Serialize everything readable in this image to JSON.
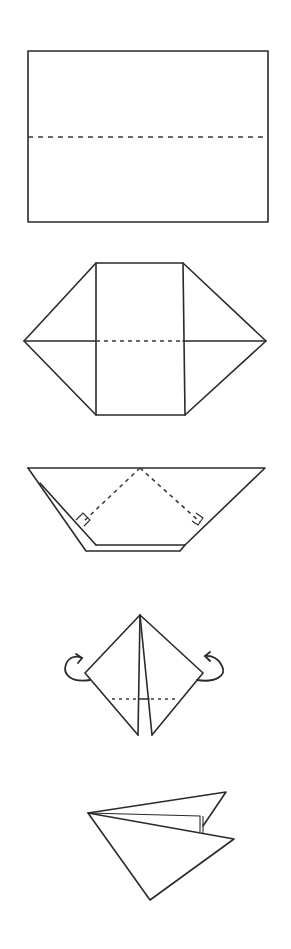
{
  "diagram": {
    "colors": {
      "line": "#2a2a2a",
      "background": "#ffffff"
    },
    "steps": [
      {
        "id": 1,
        "label": "Rectangle with horizontal valley crease",
        "description": "Fold in half along dashed line"
      },
      {
        "id": 2,
        "label": "Hexagon with corner folds",
        "description": "Corners folded to center; horizontal crease"
      },
      {
        "id": 3,
        "label": "Trapezoid with right-angle markers",
        "description": "Fold along dashed diagonals, right angles marked"
      },
      {
        "id": 4,
        "label": "Kite with turn-over arrows",
        "description": "Fold sides back along dashed line"
      },
      {
        "id": 5,
        "label": "Finished form",
        "description": "Result after folding"
      }
    ]
  }
}
